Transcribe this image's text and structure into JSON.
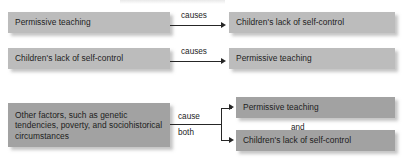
{
  "diagram": {
    "type": "flowchart",
    "title": "",
    "rows": [
      {
        "id": "row-1",
        "cause_box": "Permissive teaching",
        "relation_label": "causes",
        "effect_box": "Children's lack of self-control"
      },
      {
        "id": "row-2",
        "cause_box": "Children's lack of self-control",
        "relation_label": "causes",
        "effect_box": "Permissive teaching"
      },
      {
        "id": "row-3",
        "cause_box": "Other factors, such as genetic tendencies, poverty, and sociohistorical circumstances",
        "relation_label_top": "cause",
        "relation_label_bottom": "both",
        "effect_box_top": "Permissive teaching",
        "conjunction": "and",
        "effect_box_bottom": "Children's lack of self-control"
      }
    ],
    "colors": {
      "box_light": "#bcbcbc",
      "box_dark": "#a2a2a2",
      "line": "#262626",
      "text": "#1d1d1d",
      "background": "#ffffff"
    }
  }
}
